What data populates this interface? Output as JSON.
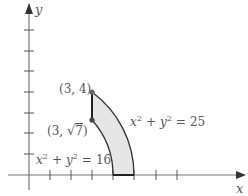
{
  "diagram": {
    "type": "region-between-circles",
    "axes": {
      "x_label": "x",
      "y_label": "y",
      "x_ticks": [
        1,
        2,
        3,
        4,
        5,
        6,
        7
      ],
      "y_ticks": [
        1,
        2,
        3,
        4,
        5,
        6,
        7
      ]
    },
    "curves": [
      {
        "name": "inner-circle",
        "equation": {
          "lhs_x": "x",
          "lhs_y": "y",
          "exp": "2",
          "plus": "+",
          "eq": "=",
          "rhs": "16"
        },
        "radius": 4
      },
      {
        "name": "outer-circle",
        "equation": {
          "lhs_x": "x",
          "lhs_y": "y",
          "exp": "2",
          "plus": "+",
          "eq": "=",
          "rhs": "25"
        },
        "radius": 5
      }
    ],
    "points": [
      {
        "label": "(3, 4)",
        "x": 3,
        "y": 4
      },
      {
        "label_prefix": "(3, ",
        "label_root": "7",
        "label_suffix": ")",
        "x": 3,
        "y_expr": "√7"
      }
    ],
    "region": {
      "description": "Region bounded by x=3, x^2+y^2=16, x^2+y^2=25, and y=0",
      "fill": "#e8e8e8"
    },
    "colors": {
      "axis": "#777777",
      "boundary": "#333333",
      "point": "#666666",
      "text": "#555555"
    }
  }
}
